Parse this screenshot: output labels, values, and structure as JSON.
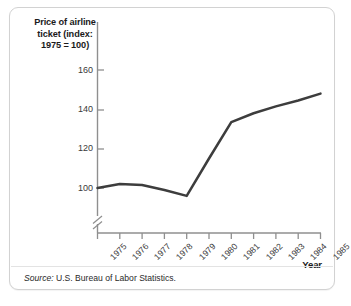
{
  "figure": {
    "y_axis_title": "Price of airline ticket (index: 1975 = 100)",
    "x_axis_title": "Year",
    "source_label": "Source:",
    "source_text": " U.S. Bureau of Labor Statistics.",
    "line_color": "#3d3d3d",
    "axis_color": "#8a8a8a",
    "border_color": "#d2d2d2"
  },
  "chart_data": {
    "type": "line",
    "title": "",
    "xlabel": "Year",
    "ylabel": "Price of airline ticket (index: 1975 = 100)",
    "x": [
      1975,
      1976,
      1977,
      1978,
      1979,
      1980,
      1981,
      1982,
      1983,
      1984,
      1985
    ],
    "xtick_labels": [
      "1975",
      "1976",
      "1977",
      "1978",
      "1979",
      "1980",
      "1981",
      "1982",
      "1983",
      "1984",
      "1985"
    ],
    "values": [
      100,
      102,
      101.5,
      99,
      96,
      115,
      133.5,
      138,
      141.5,
      144.5,
      148
    ],
    "ytick_labels": [
      "160",
      "140",
      "120",
      "100"
    ],
    "yticks": [
      160,
      140,
      120,
      100
    ],
    "ylim": [
      92,
      168
    ],
    "axis_break": true,
    "grid": false,
    "legend": "none",
    "source": "U.S. Bureau of Labor Statistics."
  }
}
